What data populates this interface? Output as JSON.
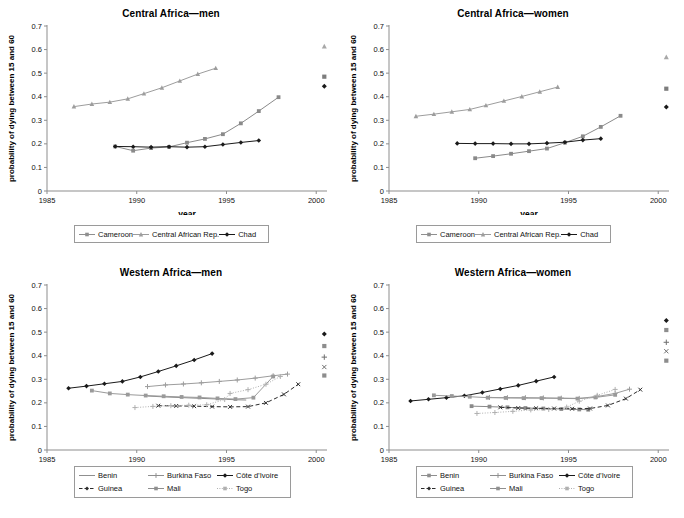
{
  "figure": {
    "background": "#ffffff",
    "panel_count": 4,
    "shared_xlabel": "year",
    "shared_ylabel": "probability of dying between 15 and 60",
    "xticks": [
      1985,
      1990,
      1995,
      2000
    ],
    "xtick_labels": [
      "1985",
      "1990",
      "1995",
      "2000"
    ],
    "yticks": [
      0,
      0.1,
      0.2,
      0.3,
      0.4,
      0.5,
      0.6,
      0.7
    ],
    "ytick_labels": [
      "0",
      "0.1",
      "0.2",
      "0.3",
      "0.4",
      "0.5",
      "0.6",
      "0.7"
    ],
    "xlim": [
      1985,
      2000.6
    ],
    "ylim": [
      0,
      0.7
    ],
    "grid": false,
    "legend_position": "below-axes"
  },
  "colors": {
    "axis": "#8d8d8d",
    "text": "#111111",
    "dark": "#1a1a1a",
    "grey_mid": "#8a8a8a",
    "grey_light": "#a6a6a6",
    "legend_border": "#9a9a9a"
  },
  "chart_data": [
    {
      "id": "central-africa-men",
      "type": "line",
      "title": "Central Africa—men",
      "xlabel": "year",
      "ylabel": "probability of dying between 15 and 60",
      "xlim": [
        1985,
        2000.6
      ],
      "ylim": [
        0,
        0.7
      ],
      "grid": false,
      "legend": [
        "Cameroon",
        "Central African Rep.",
        "Chad"
      ],
      "series": [
        {
          "name": "Cameroon",
          "marker": "square",
          "color": "#8a8a8a",
          "linestyle": "solid",
          "x": [
            1988.8,
            1989.8,
            1990.8,
            1991.8,
            1992.8,
            1993.8,
            1994.8,
            1995.8,
            1996.8,
            1997.9
          ],
          "values": [
            0.189,
            0.171,
            0.182,
            0.187,
            0.205,
            0.221,
            0.241,
            0.287,
            0.339,
            0.398
          ]
        },
        {
          "name": "Central African Rep.",
          "marker": "triangle",
          "color": "#9d9d9d",
          "linestyle": "solid",
          "x": [
            1986.5,
            1987.5,
            1988.5,
            1989.5,
            1990.4,
            1991.4,
            1992.4,
            1993.4,
            1994.4
          ],
          "values": [
            0.358,
            0.369,
            0.377,
            0.391,
            0.413,
            0.438,
            0.467,
            0.496,
            0.521
          ]
        },
        {
          "name": "Chad",
          "marker": "diamond",
          "color": "#1a1a1a",
          "linestyle": "solid",
          "x": [
            1988.8,
            1989.8,
            1990.8,
            1991.8,
            1992.8,
            1993.8,
            1994.8,
            1995.8,
            1996.8
          ],
          "values": [
            0.189,
            0.188,
            0.186,
            0.188,
            0.186,
            0.188,
            0.197,
            0.206,
            0.214
          ]
        }
      ],
      "endpoint_markers": [
        {
          "name": "Central African Rep.",
          "x": 2000.45,
          "value": 0.613,
          "marker": "triangle",
          "color": "#a8a8a8"
        },
        {
          "name": "Cameroon",
          "x": 2000.45,
          "value": 0.485,
          "marker": "square",
          "color": "#7d7d7d"
        },
        {
          "name": "Chad",
          "x": 2000.45,
          "value": 0.444,
          "marker": "diamond",
          "color": "#1a1a1a"
        }
      ]
    },
    {
      "id": "central-africa-women",
      "type": "line",
      "title": "Central Africa—women",
      "xlabel": "year",
      "ylabel": "probability of dying between 15 and 60",
      "xlim": [
        1985,
        2000.6
      ],
      "ylim": [
        0,
        0.7
      ],
      "grid": false,
      "legend": [
        "Cameroon",
        "Central African Rep.",
        "Chad"
      ],
      "series": [
        {
          "name": "Cameroon",
          "marker": "square",
          "color": "#8a8a8a",
          "linestyle": "solid",
          "x": [
            1989.8,
            1990.8,
            1991.8,
            1992.8,
            1993.8,
            1994.8,
            1995.8,
            1996.8,
            1997.9
          ],
          "values": [
            0.139,
            0.148,
            0.158,
            0.169,
            0.18,
            0.205,
            0.232,
            0.272,
            0.319
          ]
        },
        {
          "name": "Central African Rep.",
          "marker": "triangle",
          "color": "#9d9d9d",
          "linestyle": "solid",
          "x": [
            1986.5,
            1987.5,
            1988.5,
            1989.5,
            1990.4,
            1991.4,
            1992.4,
            1993.4,
            1994.4
          ],
          "values": [
            0.317,
            0.326,
            0.336,
            0.346,
            0.363,
            0.382,
            0.401,
            0.421,
            0.441
          ]
        },
        {
          "name": "Chad",
          "marker": "diamond",
          "color": "#1a1a1a",
          "linestyle": "solid",
          "x": [
            1988.8,
            1989.8,
            1990.8,
            1991.8,
            1992.8,
            1993.8,
            1994.8,
            1995.8,
            1996.8
          ],
          "values": [
            0.202,
            0.201,
            0.201,
            0.2,
            0.2,
            0.203,
            0.207,
            0.216,
            0.222
          ]
        }
      ],
      "endpoint_markers": [
        {
          "name": "Central African Rep.",
          "x": 2000.45,
          "value": 0.568,
          "marker": "triangle",
          "color": "#a8a8a8"
        },
        {
          "name": "Cameroon",
          "x": 2000.45,
          "value": 0.434,
          "marker": "square",
          "color": "#7d7d7d"
        },
        {
          "name": "Chad",
          "x": 2000.45,
          "value": 0.356,
          "marker": "diamond",
          "color": "#1a1a1a"
        }
      ]
    },
    {
      "id": "western-africa-men",
      "type": "line",
      "title": "Western Africa—men",
      "xlabel": "year",
      "ylabel": "probability of dying between 15 and 60",
      "xlim": [
        1985,
        2000.6
      ],
      "ylim": [
        0,
        0.7
      ],
      "grid": false,
      "legend": [
        "Benin",
        "Burkina Faso",
        "Côte d’Ivoire",
        "Guinea",
        "Mali",
        "Togo"
      ],
      "series": [
        {
          "name": "Benin",
          "marker": "none",
          "color": "#8a8a8a",
          "linestyle": "solid",
          "x": [
            1990.6,
            1991.6,
            1992.6,
            1993.6,
            1994.6,
            1995.6,
            1996.1
          ],
          "values": [
            0.229,
            0.225,
            0.222,
            0.219,
            0.216,
            0.213,
            0.212
          ]
        },
        {
          "name": "Burkina Faso",
          "marker": "plus",
          "color": "#9d9d9d",
          "linestyle": "solid",
          "x": [
            1990.6,
            1991.6,
            1992.6,
            1993.6,
            1994.6,
            1995.6,
            1996.6,
            1997.6,
            1998.4
          ],
          "values": [
            0.269,
            0.276,
            0.28,
            0.285,
            0.291,
            0.297,
            0.305,
            0.315,
            0.322
          ]
        },
        {
          "name": "Côte d’Ivoire",
          "marker": "diamond",
          "color": "#1a1a1a",
          "linestyle": "solid",
          "x": [
            1986.2,
            1987.2,
            1988.2,
            1989.2,
            1990.2,
            1991.2,
            1992.2,
            1993.2,
            1994.2
          ],
          "values": [
            0.262,
            0.271,
            0.281,
            0.291,
            0.31,
            0.333,
            0.357,
            0.382,
            0.409
          ]
        },
        {
          "name": "Guinea",
          "marker": "x",
          "color": "#2b2b2b",
          "linestyle": "dashed",
          "x": [
            1991.2,
            1992.2,
            1993.2,
            1994.2,
            1995.2,
            1996.2,
            1997.2,
            1998.2,
            1999.0
          ],
          "values": [
            0.188,
            0.187,
            0.186,
            0.184,
            0.183,
            0.184,
            0.2,
            0.236,
            0.279
          ]
        },
        {
          "name": "Mali",
          "marker": "square",
          "color": "#9a9a9a",
          "linestyle": "solid",
          "x": [
            1987.5,
            1988.5,
            1989.5,
            1990.5,
            1991.5,
            1992.5,
            1993.5,
            1994.5,
            1995.5,
            1996.5,
            1997.6
          ],
          "values": [
            0.252,
            0.24,
            0.235,
            0.231,
            0.228,
            0.225,
            0.223,
            0.219,
            0.216,
            0.222,
            0.312
          ]
        },
        {
          "name": "Togo",
          "marker": "plus",
          "color": "#b0b0b0",
          "linestyle": "dotted",
          "x": [
            1989.9,
            1990.9,
            1991.9,
            1992.9,
            1993.9,
            1994.9,
            1995.2,
            1996.2,
            1997.2,
            1998.0
          ],
          "values": [
            0.18,
            0.185,
            0.188,
            0.19,
            0.192,
            0.214,
            0.24,
            0.256,
            0.279,
            0.312
          ]
        }
      ],
      "endpoint_markers": [
        {
          "name": "Côte d’Ivoire",
          "x": 2000.45,
          "value": 0.492,
          "marker": "diamond",
          "color": "#1a1a1a"
        },
        {
          "name": "Burkina Faso",
          "x": 2000.45,
          "value": 0.441,
          "marker": "square",
          "color": "#8d8d8d"
        },
        {
          "name": "Togo",
          "x": 2000.45,
          "value": 0.394,
          "marker": "plus",
          "color": "#6e6e6e"
        },
        {
          "name": "Guinea",
          "x": 2000.45,
          "value": 0.352,
          "marker": "x",
          "color": "#6e6e6e"
        },
        {
          "name": "Mali",
          "x": 2000.45,
          "value": 0.316,
          "marker": "square",
          "color": "#8d8d8d"
        }
      ]
    },
    {
      "id": "western-africa-women",
      "type": "line",
      "title": "Western Africa—women",
      "xlabel": "year",
      "ylabel": "probability of dying between 15 and 60",
      "xlim": [
        1985,
        2000.6
      ],
      "ylim": [
        0,
        0.7
      ],
      "grid": false,
      "legend": [
        "Benin",
        "Burkina Faso",
        "Côte d’Ivoire",
        "Guinea",
        "Mali",
        "Togo"
      ],
      "series": [
        {
          "name": "Benin",
          "marker": "square",
          "color": "#8a8a8a",
          "linestyle": "solid",
          "x": [
            1989.6,
            1990.6,
            1991.6,
            1992.6,
            1993.6,
            1994.6,
            1995.6,
            1996.1
          ],
          "values": [
            0.186,
            0.184,
            0.181,
            0.178,
            0.176,
            0.174,
            0.172,
            0.171
          ]
        },
        {
          "name": "Burkina Faso",
          "marker": "plus",
          "color": "#9d9d9d",
          "linestyle": "solid",
          "x": [
            1990.6,
            1991.6,
            1992.6,
            1993.6,
            1994.6,
            1995.6,
            1996.6,
            1997.6,
            1998.4
          ],
          "values": [
            0.223,
            0.222,
            0.222,
            0.221,
            0.22,
            0.219,
            0.227,
            0.24,
            0.258
          ]
        },
        {
          "name": "Côte d’Ivoire",
          "marker": "diamond",
          "color": "#1a1a1a",
          "linestyle": "solid",
          "x": [
            1986.2,
            1987.2,
            1988.2,
            1989.2,
            1990.2,
            1991.2,
            1992.2,
            1993.2,
            1994.2
          ],
          "values": [
            0.208,
            0.215,
            0.222,
            0.23,
            0.244,
            0.259,
            0.274,
            0.292,
            0.31
          ]
        },
        {
          "name": "Guinea",
          "marker": "x",
          "color": "#2b2b2b",
          "linestyle": "dashed",
          "x": [
            1991.2,
            1992.2,
            1993.2,
            1994.2,
            1995.2,
            1996.2,
            1997.2,
            1998.2,
            1999.0
          ],
          "values": [
            0.181,
            0.178,
            0.177,
            0.176,
            0.175,
            0.176,
            0.189,
            0.218,
            0.256
          ]
        },
        {
          "name": "Mali",
          "marker": "square",
          "color": "#9a9a9a",
          "linestyle": "solid",
          "x": [
            1987.5,
            1988.5,
            1989.5,
            1990.5,
            1991.5,
            1992.5,
            1993.5,
            1994.5,
            1995.5,
            1996.5,
            1997.6
          ],
          "values": [
            0.232,
            0.229,
            0.226,
            0.222,
            0.221,
            0.22,
            0.22,
            0.219,
            0.218,
            0.223,
            0.234
          ]
        },
        {
          "name": "Togo",
          "marker": "plus",
          "color": "#b0b0b0",
          "linestyle": "dotted",
          "x": [
            1989.9,
            1990.9,
            1991.9,
            1992.9,
            1993.9,
            1994.9,
            1995.6,
            1996.6,
            1997.6
          ],
          "values": [
            0.155,
            0.159,
            0.164,
            0.17,
            0.172,
            0.182,
            0.207,
            0.232,
            0.257
          ]
        }
      ],
      "endpoint_markers": [
        {
          "name": "Côte d’Ivoire",
          "x": 2000.45,
          "value": 0.549,
          "marker": "diamond",
          "color": "#1a1a1a"
        },
        {
          "name": "Burkina Faso",
          "x": 2000.45,
          "value": 0.509,
          "marker": "square",
          "color": "#8d8d8d"
        },
        {
          "name": "Togo",
          "x": 2000.45,
          "value": 0.457,
          "marker": "plus",
          "color": "#6e6e6e"
        },
        {
          "name": "Guinea",
          "x": 2000.45,
          "value": 0.419,
          "marker": "x",
          "color": "#6e6e6e"
        },
        {
          "name": "Mali",
          "x": 2000.45,
          "value": 0.379,
          "marker": "square",
          "color": "#8d8d8d"
        }
      ]
    }
  ]
}
